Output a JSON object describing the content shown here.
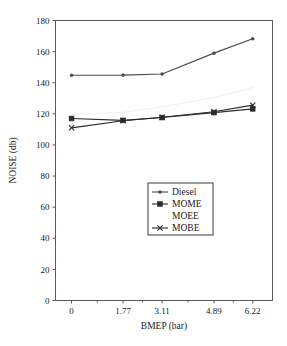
{
  "figure": {
    "caption_fragment": "",
    "background": "#ffffff"
  },
  "chart_data": {
    "type": "line",
    "title": "",
    "xlabel": "BMEP (bar)",
    "ylabel": "NOISE (db)",
    "x": [
      0,
      1.77,
      3.11,
      4.89,
      6.22
    ],
    "xtick_labels": [
      "0",
      "1.77",
      "3.11",
      "4.89",
      "6.22"
    ],
    "ytick_labels": [
      "0",
      "20",
      "40",
      "60",
      "80",
      "100",
      "120",
      "140",
      "160",
      "180"
    ],
    "yticks": [
      0,
      20,
      40,
      60,
      80,
      100,
      120,
      140,
      160,
      180
    ],
    "ylim": [
      0,
      180
    ],
    "xlim": [
      -0.55,
      6.9
    ],
    "grid": false,
    "legend_position": "center-lower",
    "series": [
      {
        "name": "Diesel",
        "values": [
          144.8,
          144.9,
          145.6,
          159.0,
          168.3
        ],
        "color": "#4a4a4a",
        "marker": "dot",
        "line_width": 1.2
      },
      {
        "name": "MOME",
        "values": [
          117.0,
          115.8,
          117.6,
          120.8,
          123.2
        ],
        "color": "#2b2b2b",
        "marker": "square",
        "line_width": 1.1
      },
      {
        "name": "MOEE",
        "values": [
          119.5,
          121.0,
          124.5,
          130.5,
          137.0
        ],
        "color": "#f0f0f0",
        "marker": "none",
        "line_width": 1.0
      },
      {
        "name": "MOBE",
        "values": [
          111.0,
          115.6,
          117.8,
          121.3,
          125.6
        ],
        "color": "#2b2b2b",
        "marker": "x",
        "line_width": 1.1
      }
    ]
  },
  "legend": {
    "entries": [
      {
        "label": "Diesel",
        "marker": "dot"
      },
      {
        "label": "MOME",
        "marker": "square"
      },
      {
        "label": "MOEE",
        "marker": "none"
      },
      {
        "label": "MOBE",
        "marker": "x"
      }
    ]
  }
}
